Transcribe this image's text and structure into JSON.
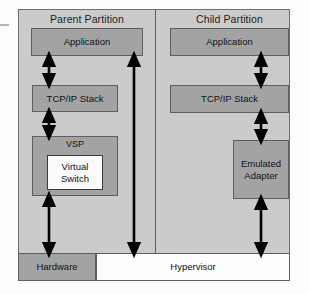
{
  "diagram": {
    "title_parent": "Parent Partition",
    "title_child": "Child Partition",
    "colors": {
      "panel_background": "#cbcbcb",
      "node_fill": "#a3a3a3",
      "node_border": "#5e5e5e",
      "white_fill": "#fbfbfb",
      "arrow": "#000000",
      "page_background": "#fdfdfd"
    },
    "parent_partition": {
      "application": "Application",
      "tcpip_stack": "TCP/IP Stack",
      "vsp": "VSP",
      "virtual_switch": "Virtual\nSwitch",
      "virtual_switch_line1": "Virtual",
      "virtual_switch_line2": "Switch"
    },
    "child_partition": {
      "application": "Application",
      "tcpip_stack": "TCP/IP Stack",
      "emulated_adapter_line1": "Emulated",
      "emulated_adapter_line2": "Adapter"
    },
    "bottom": {
      "hardware": "Hardware",
      "hypervisor": "Hypervisor"
    },
    "connectors": [
      {
        "name": "parent-application-to-tcpip",
        "style": "double-headed",
        "from": "Application",
        "to": "TCP/IP Stack"
      },
      {
        "name": "parent-tcpip-to-vsp",
        "style": "double-headed",
        "from": "TCP/IP Stack",
        "to": "VSP"
      },
      {
        "name": "parent-vsp-to-hardware",
        "style": "double-headed",
        "from": "VSP",
        "to": "Hardware"
      },
      {
        "name": "parent-application-to-hypervisor",
        "style": "double-headed",
        "from": "Application",
        "to": "Hypervisor"
      },
      {
        "name": "child-application-to-tcpip",
        "style": "double-headed",
        "from": "Application",
        "to": "TCP/IP Stack"
      },
      {
        "name": "child-tcpip-to-emulated-adapter",
        "style": "double-headed",
        "from": "TCP/IP Stack",
        "to": "Emulated Adapter"
      },
      {
        "name": "child-emulated-adapter-to-hypervisor",
        "style": "double-headed",
        "from": "Emulated Adapter",
        "to": "Hypervisor"
      }
    ]
  }
}
